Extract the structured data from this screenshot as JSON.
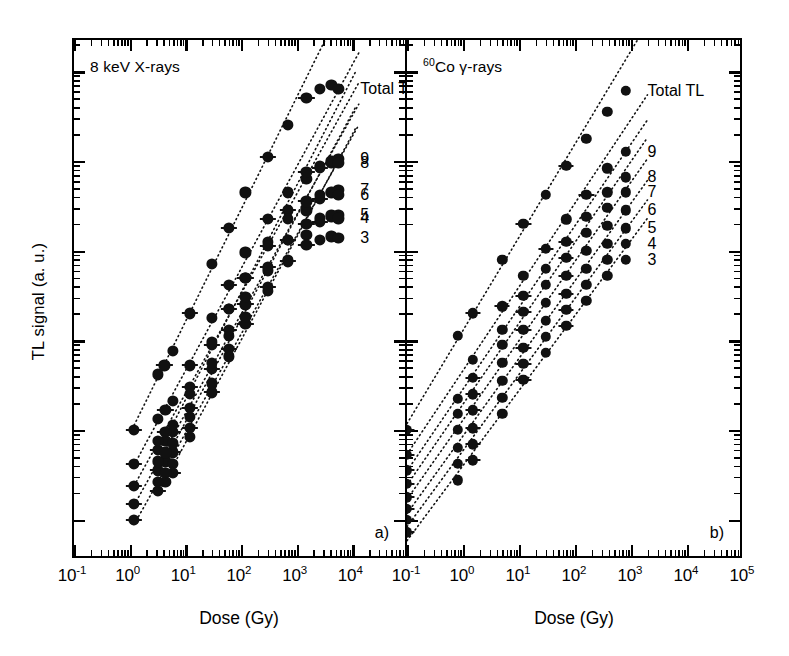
{
  "figure": {
    "ylabel": "TL signal (a. u.)",
    "xlabel_a": "Dose (Gy)",
    "xlabel_b": "Dose (Gy)"
  },
  "panel_a": {
    "tag": "a)",
    "note": "8 keV X-rays",
    "note_prefix": "",
    "xticks": [
      "10-1",
      "100",
      "101",
      "102",
      "103",
      "104"
    ],
    "xtick_mantissa": [
      "10",
      "10",
      "10",
      "10",
      "10",
      "10"
    ],
    "xtick_exponent": [
      "-1",
      "0",
      "1",
      "2",
      "3",
      "4"
    ],
    "curve_labels": [
      "Total TL",
      "9",
      "8",
      "7",
      "6",
      "5",
      "4",
      "3"
    ]
  },
  "panel_b": {
    "tag": "b)",
    "note_sup": "60",
    "note": "Co γ-rays",
    "xticks": [
      "10-1",
      "100",
      "101",
      "102",
      "103",
      "104",
      "105"
    ],
    "xtick_mantissa": [
      "10",
      "10",
      "10",
      "10",
      "10",
      "10",
      "10"
    ],
    "xtick_exponent": [
      "-1",
      "0",
      "1",
      "2",
      "3",
      "4",
      "5"
    ],
    "curve_labels": [
      "Total TL",
      "9",
      "8",
      "7",
      "6",
      "5",
      "4",
      "3"
    ]
  },
  "chart_data": {
    "type": "scatter",
    "title": "",
    "xlabel": "Dose (Gy)",
    "ylabel": "TL signal (a. u.)",
    "xscale": "log",
    "yscale": "log",
    "grid": false,
    "legend": "inline-right-labels",
    "marker": "filled-circle-with-x-error-bars",
    "fit": "dotted-straight-line",
    "panels": [
      {
        "id": "a",
        "tag": "a)",
        "annotation": "8 keV X-rays",
        "xlim": [
          0.1,
          100000
        ],
        "xticklabels": [
          "10^-1",
          "10^0",
          "10^1",
          "10^2",
          "10^3",
          "10^4"
        ],
        "series": [
          {
            "name": "Total TL",
            "x": [
              1.2,
              3.2,
              4.2,
              6.0,
              12,
              30,
              60,
              120,
              300,
              700,
              1500,
              2600,
              4200,
              5600
            ],
            "y": [
              1.0,
              1.62,
              1.72,
              1.88,
              2.3,
              2.85,
              3.25,
              3.65,
              4.05,
              4.4,
              4.7,
              4.8,
              4.85,
              4.8
            ]
          },
          {
            "name": "9",
            "x": [
              3.2,
              4.4,
              6.0,
              12,
              30,
              60,
              120,
              300,
              700,
              1500,
              2600,
              4200,
              5600
            ],
            "y": [
              0.78,
              0.88,
              0.98,
              1.4,
              1.95,
              2.35,
              2.7,
              3.1,
              3.45,
              3.8,
              3.92,
              3.98,
              4.02
            ]
          },
          {
            "name": "8",
            "x": [
              1.2,
              3.2,
              4.4,
              6.0,
              12,
              30,
              60,
              120,
              300,
              700,
              1500,
              2600,
              4200,
              5600
            ],
            "y": [
              0.62,
              1.12,
              1.22,
              1.32,
              1.72,
              2.25,
              2.62,
              2.98,
              3.35,
              3.65,
              3.88,
              3.95,
              4.0,
              3.98
            ]
          },
          {
            "name": "7",
            "x": [
              3.2,
              4.4,
              6.0,
              12,
              30,
              60,
              120,
              300,
              700,
              1500,
              2600,
              4200,
              5600
            ],
            "y": [
              0.55,
              0.65,
              0.75,
              1.15,
              1.68,
              2.05,
              2.4,
              2.78,
              3.12,
              3.45,
              3.58,
              3.64,
              3.68
            ]
          },
          {
            "name": "6",
            "x": [
              1.2,
              3.2,
              4.4,
              6.0,
              12,
              30,
              60,
              120,
              300,
              700,
              1500,
              2600,
              4200,
              5600
            ],
            "y": [
              0.38,
              0.88,
              0.98,
              1.06,
              1.48,
              1.98,
              2.35,
              2.7,
              3.05,
              3.35,
              3.55,
              3.62,
              3.66,
              3.62
            ]
          },
          {
            "name": "5",
            "x": [
              3.2,
              4.4,
              6.0,
              12,
              30,
              60,
              120,
              300,
              700,
              1500,
              2600,
              4200,
              5600
            ],
            "y": [
              0.32,
              0.42,
              0.52,
              0.92,
              1.42,
              1.82,
              2.18,
              2.55,
              2.88,
              3.18,
              3.32,
              3.38,
              3.4
            ]
          },
          {
            "name": "4",
            "x": [
              1.2,
              3.2,
              4.4,
              6.0,
              12,
              30,
              60,
              120,
              300,
              700,
              1500,
              2600,
              4200,
              5600
            ],
            "y": [
              0.18,
              0.65,
              0.75,
              0.85,
              1.25,
              1.75,
              2.12,
              2.48,
              2.82,
              3.12,
              3.3,
              3.36,
              3.4,
              3.36
            ]
          },
          {
            "name": "3",
            "x": [
              1.2,
              3.2,
              4.4,
              6.0,
              12,
              30,
              60,
              120,
              300,
              700,
              1500,
              2600,
              4200,
              5600
            ],
            "y": [
              0.0,
              0.42,
              0.52,
              0.62,
              1.02,
              1.52,
              1.9,
              2.26,
              2.6,
              2.9,
              3.06,
              3.12,
              3.16,
              3.14
            ]
          }
        ]
      },
      {
        "id": "b",
        "tag": "b)",
        "annotation": "60Co γ-rays",
        "xlim": [
          0.1,
          100000
        ],
        "xticklabels": [
          "10^-1",
          "10^0",
          "10^1",
          "10^2",
          "10^3",
          "10^4",
          "10^5"
        ],
        "series": [
          {
            "name": "Total TL",
            "x": [
              0.1,
              0.8,
              1.5,
              5.0,
              12,
              30,
              70,
              160,
              380,
              800
            ],
            "y": [
              1.0,
              2.05,
              2.3,
              2.9,
              3.3,
              3.62,
              3.95,
              4.25,
              4.55,
              4.78
            ]
          },
          {
            "name": "9",
            "x": [
              0.1,
              1.5,
              5.0,
              12,
              30,
              70,
              160,
              380,
              800
            ],
            "y": [
              0.72,
              1.78,
              2.38,
              2.72,
              3.02,
              3.35,
              3.62,
              3.92,
              4.1
            ]
          },
          {
            "name": "8",
            "x": [
              0.1,
              0.8,
              1.5,
              5.0,
              12,
              30,
              70,
              160,
              380,
              800
            ],
            "y": [
              0.55,
              1.35,
              1.58,
              2.12,
              2.5,
              2.8,
              3.1,
              3.38,
              3.65,
              3.82
            ]
          },
          {
            "name": "7",
            "x": [
              0.1,
              0.8,
              1.5,
              5.0,
              12,
              30,
              70,
              160,
              380,
              800
            ],
            "y": [
              0.4,
              1.18,
              1.4,
              1.95,
              2.32,
              2.62,
              2.92,
              3.2,
              3.48,
              3.65
            ]
          },
          {
            "name": "6",
            "x": [
              0.1,
              0.8,
              1.5,
              5.0,
              12,
              30,
              70,
              160,
              380,
              800
            ],
            "y": [
              0.25,
              1.0,
              1.22,
              1.75,
              2.12,
              2.42,
              2.72,
              3.0,
              3.28,
              3.45
            ]
          },
          {
            "name": "5",
            "x": [
              0.1,
              0.8,
              1.5,
              5.0,
              12,
              30,
              70,
              160,
              380,
              800
            ],
            "y": [
              0.12,
              0.8,
              1.02,
              1.55,
              1.92,
              2.22,
              2.52,
              2.8,
              3.08,
              3.25
            ]
          },
          {
            "name": "4",
            "x": [
              0.1,
              0.8,
              1.5,
              5.0,
              12,
              30,
              70,
              160,
              380,
              800
            ],
            "y": [
              0.0,
              0.62,
              0.84,
              1.36,
              1.74,
              2.04,
              2.34,
              2.62,
              2.9,
              3.08
            ]
          },
          {
            "name": "3",
            "x": [
              0.1,
              0.8,
              1.5,
              5.0,
              12,
              30,
              70,
              160,
              380,
              800
            ],
            "y": [
              -0.14,
              0.44,
              0.66,
              1.18,
              1.56,
              1.86,
              2.16,
              2.44,
              2.72,
              2.9
            ]
          }
        ]
      }
    ]
  }
}
